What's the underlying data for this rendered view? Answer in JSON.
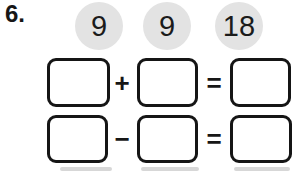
{
  "page": {
    "problem_number": "6.",
    "background_color": "#ffffff",
    "ink_color": "#161616"
  },
  "number_bank": {
    "circle_color": "#e3e3e3",
    "numbers": [
      "9",
      "9",
      "18"
    ]
  },
  "equations": [
    {
      "operator": "+",
      "equals_sign": "=",
      "box1_value": "",
      "box2_value": "",
      "result_value": ""
    },
    {
      "operator": "−",
      "equals_sign": "=",
      "box1_value": "",
      "box2_value": "",
      "result_value": ""
    }
  ]
}
